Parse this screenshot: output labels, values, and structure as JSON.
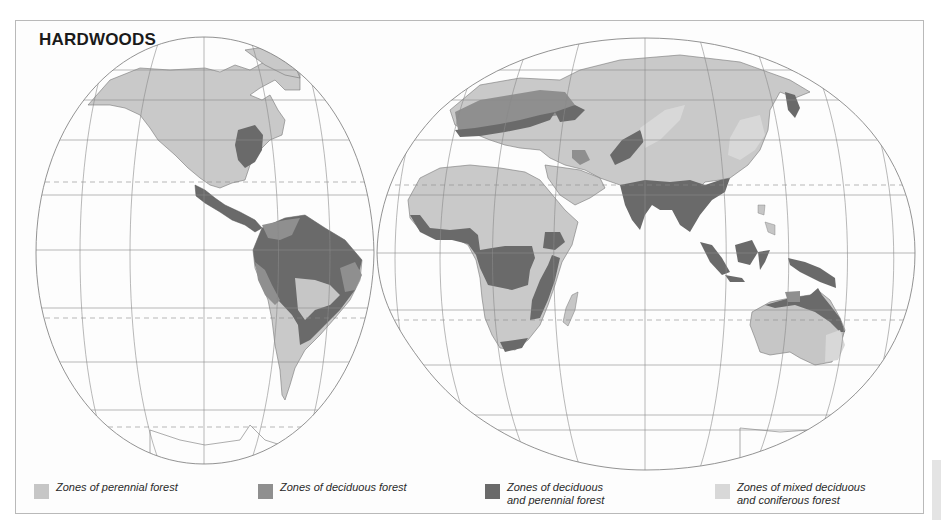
{
  "title": "HARDWOODS",
  "colors": {
    "perennial": "#c6c6c6",
    "deciduous": "#8f8f8f",
    "deciduous_perennial": "#6a6a6a",
    "mixed": "#d8d8d8",
    "land_other": "#c9c9c9",
    "graticule": "#8a8a8a",
    "background": "#fdfdfd"
  },
  "legend": [
    {
      "id": "perennial",
      "label": "Zones of perennial forest",
      "color": "#c6c6c6"
    },
    {
      "id": "deciduous",
      "label": "Zones of deciduous forest",
      "color": "#8f8f8f"
    },
    {
      "id": "deciduous-perennial",
      "label": "Zones of deciduous\nand perennial forest",
      "color": "#6a6a6a"
    },
    {
      "id": "mixed",
      "label": "Zones of mixed deciduous\nand coniferous forest",
      "color": "#d8d8d8"
    }
  ]
}
